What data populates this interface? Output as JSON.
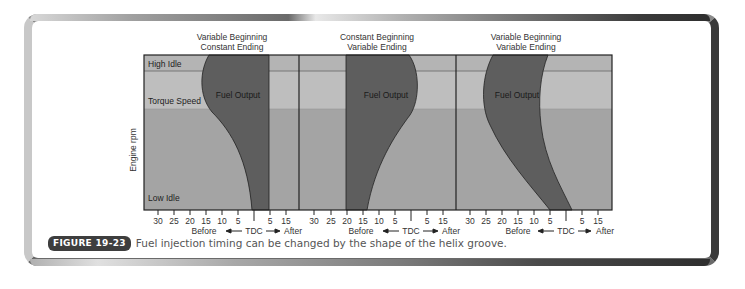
{
  "figure": {
    "label": "FIGURE 19-23",
    "caption": "Fuel injection timing can be changed by the shape of the helix groove."
  },
  "y_axis": {
    "label": "Engine rpm",
    "bands": [
      {
        "label": "High Idle",
        "color": "#b4b4b4"
      },
      {
        "label": "Torque Speed",
        "color": "#bdbdbd"
      },
      {
        "label": "Low Idle",
        "color": "#a3a3a3"
      }
    ]
  },
  "colors": {
    "fuel_output": "#5e5e5e",
    "high_idle_band": "#b4b4b4",
    "torque_band": "#bebebe",
    "low_band": "#a4a4a4",
    "frame_dark": "#333333"
  },
  "panels": [
    {
      "title_line1": "Variable Beginning",
      "title_line2": "Constant Ending",
      "region_label": "Fuel Output"
    },
    {
      "title_line1": "Constant Beginning",
      "title_line2": "Variable Ending",
      "region_label": "Fuel Output"
    },
    {
      "title_line1": "Variable Beginning",
      "title_line2": "Variable Ending",
      "region_label": "Fuel Output"
    }
  ],
  "x_axis": {
    "ticks": [
      "30",
      "25",
      "20",
      "15",
      "10",
      "5",
      "",
      "5",
      "15"
    ],
    "before_label": "Before",
    "tdc_label": "TDC",
    "after_label": "After"
  }
}
